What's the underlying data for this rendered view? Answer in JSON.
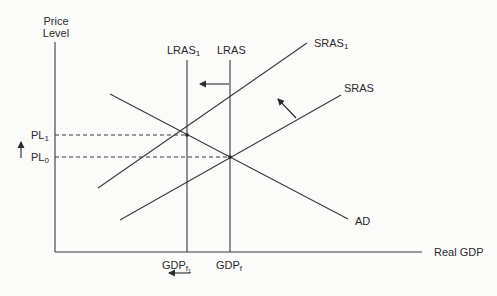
{
  "diagram": {
    "type": "aggregate-supply-demand",
    "colors": {
      "line": "#3a3a3a",
      "background": "#fbfbfa",
      "text": "#2a2a2a"
    },
    "axes": {
      "y_label_line1": "Price",
      "y_label_line2": "Level",
      "x_label": "Real GDP"
    },
    "curves": {
      "lras1": {
        "base": "LRAS",
        "sub": "1"
      },
      "lras": {
        "base": "LRAS"
      },
      "sras1": {
        "base": "SRAS",
        "sub": "1"
      },
      "sras": {
        "base": "SRAS"
      },
      "ad": {
        "base": "AD"
      }
    },
    "price_levels": {
      "pl1": {
        "base": "PL",
        "sub": "1"
      },
      "pl0": {
        "base": "PL",
        "sub": "0"
      }
    },
    "gdp_levels": {
      "gdpf1": {
        "base": "GDP",
        "sub": "f",
        "subsub": "1"
      },
      "gdpf": {
        "base": "GDP",
        "sub": "f"
      }
    },
    "arrows": [
      {
        "meaning": "LRAS shifts left",
        "direction": "left"
      },
      {
        "meaning": "SRAS shifts up-left",
        "direction": "up-left"
      },
      {
        "meaning": "Price level rises",
        "direction": "up"
      },
      {
        "meaning": "Full-employment GDP falls",
        "direction": "left"
      }
    ]
  }
}
